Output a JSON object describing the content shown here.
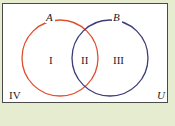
{
  "diagram": {
    "type": "venn",
    "universe_label": "U",
    "sets": [
      {
        "name": "A",
        "color": "#e0502f"
      },
      {
        "name": "B",
        "color": "#3c3c7a"
      }
    ],
    "regions": [
      {
        "id": "I",
        "label": "I",
        "description": "A only"
      },
      {
        "id": "II",
        "label": "II",
        "description": "A and B"
      },
      {
        "id": "III",
        "label": "III",
        "description": "B only"
      },
      {
        "id": "IV",
        "label": "IV",
        "description": "neither A nor B"
      }
    ],
    "colors": {
      "background": "#e6eccf",
      "frame_fill": "#ffffff",
      "frame_border": "#4a4a4a"
    }
  }
}
